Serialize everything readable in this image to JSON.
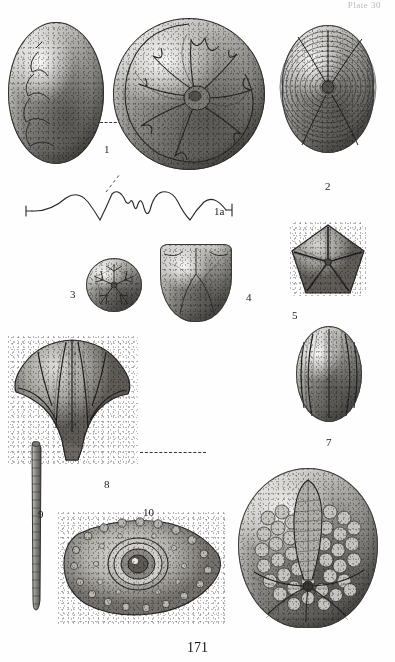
{
  "page": {
    "running_head": "Plate 30",
    "page_number": "171",
    "background_color": "#fefefe",
    "ink_color": "#2b2b2b"
  },
  "plate": {
    "kind": "paleontological-plate",
    "figure_count": 11,
    "figures": [
      {
        "id": "fig1",
        "label": "1",
        "label_x": 104,
        "label_y": 143,
        "subject": "ammonite-ventral-oval",
        "description": "Smooth elongate oval shell seen from the venter with impressed suture traces on left flank",
        "x": 8,
        "y": 22,
        "w": 96,
        "h": 142
      },
      {
        "id": "fig1b",
        "label": "",
        "subject": "ammonite-lateral-spiral",
        "description": "Coiled ammonite in side view showing involute whorl and branching suture lines around the umbilicus",
        "x": 113,
        "y": 18,
        "w": 152,
        "h": 152
      },
      {
        "id": "fig1a",
        "label": "1a",
        "label_x": 214,
        "label_y": 205,
        "subject": "suture-line-diagram",
        "description": "Drawn-out suture line with terminal tick brackets, saddles and lobes",
        "x": 22,
        "y": 186,
        "w": 214,
        "h": 40
      },
      {
        "id": "fig2",
        "label": "2",
        "label_x": 325,
        "label_y": 180,
        "subject": "concentric-striated-shell",
        "description": "Sub-circular valve with fine concentric growth striae radiating from a central umbo",
        "x": 282,
        "y": 25,
        "w": 92,
        "h": 128
      },
      {
        "id": "fig3",
        "label": "3",
        "label_x": 70,
        "label_y": 288,
        "subject": "star-pattern-disc",
        "description": "Small rounded theca, oral view, with five-rayed stellate ambulacral pattern",
        "x": 86,
        "y": 258,
        "w": 56,
        "h": 54
      },
      {
        "id": "fig4",
        "label": "4",
        "label_x": 246,
        "label_y": 291,
        "subject": "shield-shaped-calyx",
        "description": "Shield-shaped calyx in lateral view, flat-topped with rounded base",
        "x": 160,
        "y": 244,
        "w": 72,
        "h": 78
      },
      {
        "id": "fig5",
        "label": "5",
        "label_x": 292,
        "label_y": 309,
        "subject": "pentagonal-blastoid-oral",
        "description": "Pentagonal blastoid seen from above with five narrow ambulacra meeting at the mouth",
        "x": 290,
        "y": 222,
        "w": 76,
        "h": 74
      },
      {
        "id": "fig6",
        "label": "6",
        "label_x": 326,
        "label_y": 436,
        "subject": "ribbed-ovoid-theca",
        "description": "Ovoid theca in side view with five raised longitudinal ambulacral ribs",
        "x": 296,
        "y": 326,
        "w": 66,
        "h": 96
      },
      {
        "id": "fig7",
        "label": "7",
        "label_x": 104,
        "label_y": 478,
        "subject": "large-blastoid-lateral",
        "description": "Large blastoid calyx in lateral view, broad shouldered with tapering stem facet",
        "x": 8,
        "y": 336,
        "w": 130,
        "h": 128
      },
      {
        "id": "fig8",
        "label": "8",
        "label_x": 38,
        "label_y": 508,
        "subject": "crinoid-column-stem",
        "description": "Long slender crinoid column of stacked discoid columnals",
        "x": 30,
        "y": 440,
        "w": 14,
        "h": 172
      },
      {
        "id": "fig9",
        "label": "9",
        "label_x": 143,
        "label_y": 506,
        "subject": "tubercled-interambulacral-plate",
        "description": "Angular plate bearing a large central tubercle with areole and a marginal row of small tubercles",
        "x": 58,
        "y": 512,
        "w": 170,
        "h": 112
      },
      {
        "id": "fig10",
        "label": "10",
        "label_x": 230,
        "label_y": 620,
        "subject": "tessellated-echinoid-test",
        "description": "Large tessellated echinoid test covered with polygonal plates and a broad petaloid ambulacrum",
        "x": 238,
        "y": 468,
        "w": 140,
        "h": 160
      }
    ],
    "leaders": [
      {
        "name": "leader-fig1-to-spiral",
        "x": 100,
        "y": 122,
        "w": 26
      },
      {
        "name": "leader-fig7-to-fig9",
        "x": 140,
        "y": 452,
        "w": 66
      }
    ]
  }
}
